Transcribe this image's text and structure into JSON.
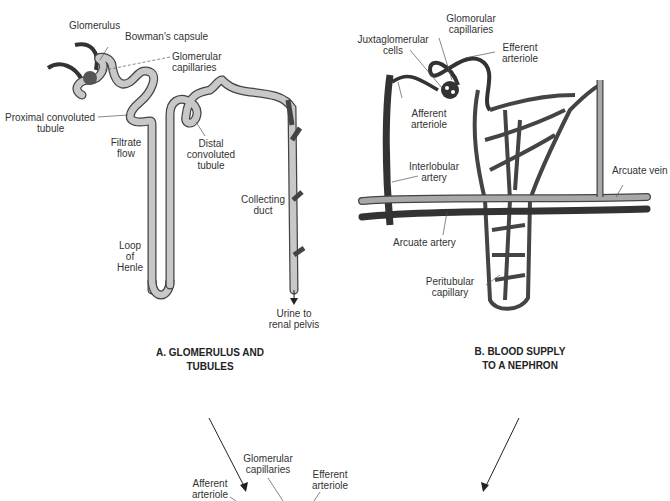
{
  "panel_a": {
    "title_line1": "A. GLOMERULUS AND",
    "title_line2": "TUBULES",
    "labels": {
      "glomerulus": "Glomerulus",
      "bowmans_capsule": "Bowman's capsule",
      "glomerular_capillaries_1": "Glomerular",
      "glomerular_capillaries_2": "capillaries",
      "proximal_1": "Proximal convoluted",
      "proximal_2": "tubule",
      "filtrate_1": "Filtrate",
      "filtrate_2": "flow",
      "distal_1": "Distal",
      "distal_2": "convoluted",
      "distal_3": "tubule",
      "collecting_1": "Collecting",
      "collecting_2": "duct",
      "loop_1": "Loop",
      "loop_2": "of",
      "loop_3": "Henle",
      "urine_1": "Urine to",
      "urine_2": "renal pelvis"
    }
  },
  "panel_b": {
    "title_line1": "B. BLOOD SUPPLY",
    "title_line2": "TO A NEPHRON",
    "labels": {
      "glomerular_capillaries_1": "Glomorular",
      "glomerular_capillaries_2": "capillaries",
      "juxta_1": "Juxtaglomerular",
      "juxta_2": "cells",
      "efferent_1": "Efferent",
      "efferent_2": "arteriole",
      "afferent_1": "Afferent",
      "afferent_2": "arteriole",
      "interlobular_1": "Interlobular",
      "interlobular_2": "artery",
      "arcuate_vein": "Arcuate vein",
      "arcuate_artery": "Arcuate artery",
      "peritubular_1": "Peritubular",
      "peritubular_2": "capillary"
    }
  },
  "panel_c": {
    "labels": {
      "glomerular_1": "Glomerular",
      "glomerular_2": "capillaries",
      "efferent_1": "Efferent",
      "efferent_2": "arteriole",
      "afferent_1": "Afferent",
      "afferent_2": "arteriole"
    }
  },
  "colors": {
    "tubule_fill": "#c8c8c8",
    "vessel_dark": "#3a3a3a",
    "vein_light": "#a8a8a8",
    "text": "#333333"
  }
}
